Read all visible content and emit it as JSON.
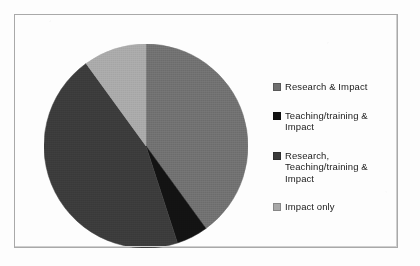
{
  "chart_data": {
    "type": "pie",
    "title": "",
    "subtitle": "",
    "xlabel": "",
    "ylabel": "",
    "legend_position": "right",
    "grid": false,
    "start_angle_deg": 0,
    "direction": "clockwise",
    "categories": [
      "Research & Impact",
      "Teaching/training & Impact",
      "Research, Teaching/training & Impact",
      "Impact only"
    ],
    "values": [
      40,
      5,
      45,
      10
    ],
    "units": "percent",
    "slices": [
      {
        "label": "Research & Impact",
        "value": 40,
        "color": "#6f6f6f",
        "start_deg": 0,
        "end_deg": 144
      },
      {
        "label": "Teaching/training & Impact",
        "value": 5,
        "color": "#121212",
        "start_deg": 144,
        "end_deg": 162
      },
      {
        "label": "Research, Teaching/training & Impact",
        "value": 45,
        "color": "#3a3a3a",
        "start_deg": 162,
        "end_deg": 324
      },
      {
        "label": "Impact only",
        "value": 10,
        "color": "#a8a8a8",
        "start_deg": 324,
        "end_deg": 360
      }
    ]
  },
  "legend": {
    "items": [
      {
        "label": "Research & Impact",
        "color": "#6f6f6f"
      },
      {
        "label": "Teaching/training &\nImpact",
        "color": "#121212"
      },
      {
        "label": "Research,\nTeaching/training &\nImpact",
        "color": "#3a3a3a"
      },
      {
        "label": "Impact only",
        "color": "#a8a8a8"
      }
    ]
  },
  "colors": {
    "frame_border": "#a9a9a9",
    "page_background": "#fdfdfd",
    "text": "#1b1b1b"
  }
}
